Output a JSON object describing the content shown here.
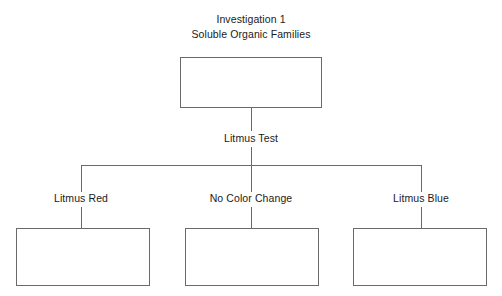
{
  "diagram": {
    "type": "flowchart",
    "title_lines": [
      "Investigation 1",
      "Soluble Organic Families"
    ],
    "root_box": {
      "label": "",
      "x": 180,
      "y": 57,
      "width": 142,
      "height": 51
    },
    "decision_label": "Litmus Test",
    "branches": [
      {
        "label": "Litmus Red",
        "center_x": 81,
        "box": {
          "label": "",
          "x": 16,
          "y": 228,
          "width": 134,
          "height": 58
        }
      },
      {
        "label": "No Color Change",
        "center_x": 251,
        "box": {
          "label": "",
          "x": 185,
          "y": 228,
          "width": 134,
          "height": 58
        }
      },
      {
        "label": "Litmus Blue",
        "center_x": 421,
        "box": {
          "label": "",
          "x": 353,
          "y": 228,
          "width": 134,
          "height": 58
        }
      }
    ],
    "colors": {
      "line": "#6a6a6a",
      "text": "#1a1a1a",
      "background": "#ffffff"
    }
  }
}
